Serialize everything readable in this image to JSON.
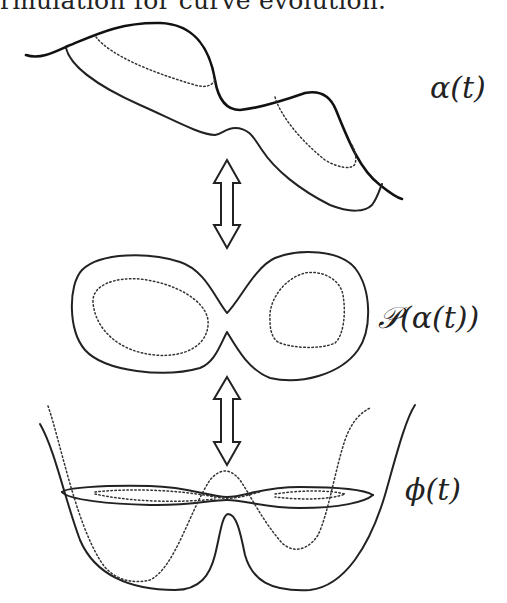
{
  "caption": {
    "text": "rmulation for curve evolution."
  },
  "figure": {
    "panels": [
      {
        "id": "alpha",
        "label": "α(t)",
        "description": "evolving curve on surface"
      },
      {
        "id": "projection",
        "label": "𝒫(α(t))",
        "description": "projected curve in plane"
      },
      {
        "id": "phi",
        "label": "ϕ(t)",
        "description": "level-set function"
      }
    ],
    "arrows": [
      {
        "id": "arrow-1",
        "type": "double-headed",
        "between": [
          "alpha",
          "projection"
        ]
      },
      {
        "id": "arrow-2",
        "type": "double-headed",
        "between": [
          "projection",
          "phi"
        ]
      }
    ],
    "colors": {
      "stroke": "#222222",
      "background": "#ffffff"
    }
  }
}
